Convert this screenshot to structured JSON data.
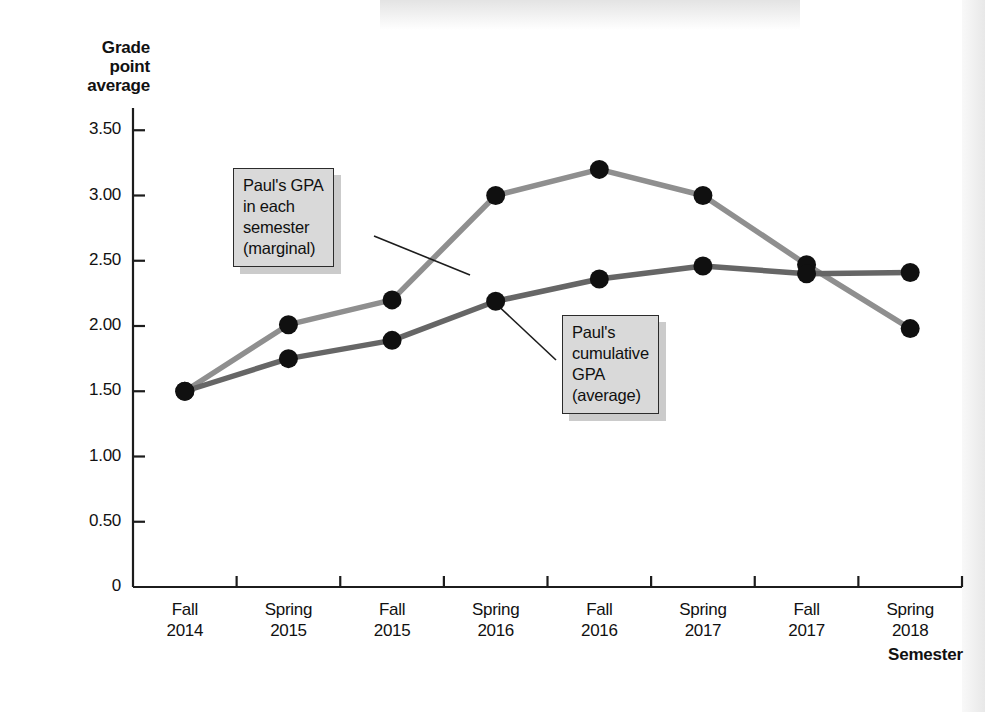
{
  "chart_data": {
    "type": "line",
    "title": "",
    "xlabel": "Semester",
    "ylabel": "Grade point average",
    "categories": [
      "Fall 2014",
      "Spring 2015",
      "Fall 2015",
      "Spring 2016",
      "Fall 2016",
      "Spring 2017",
      "Fall 2017",
      "Spring 2018"
    ],
    "category_lines": [
      [
        "Fall",
        "2014"
      ],
      [
        "Spring",
        "2015"
      ],
      [
        "Fall",
        "2015"
      ],
      [
        "Spring",
        "2016"
      ],
      [
        "Fall",
        "2016"
      ],
      [
        "Spring",
        "2017"
      ],
      [
        "Fall",
        "2017"
      ],
      [
        "Spring",
        "2018"
      ]
    ],
    "ylim": [
      0,
      3.75
    ],
    "yticks": [
      0,
      0.5,
      1.0,
      1.5,
      2.0,
      2.5,
      3.0,
      3.5
    ],
    "ytick_labels": [
      "0",
      "0.50",
      "1.00",
      "1.50",
      "2.00",
      "2.50",
      "3.00",
      "3.50"
    ],
    "grid": false,
    "legend_position": "annotations",
    "series": [
      {
        "name": "Paul's GPA in each semester (marginal)",
        "color": "#8f8f8f",
        "marker_color": "#101010",
        "values": [
          1.5,
          2.01,
          2.2,
          3.0,
          3.2,
          3.0,
          2.47,
          1.98
        ]
      },
      {
        "name": "Paul's cumulative GPA (average)",
        "color": "#666666",
        "marker_color": "#101010",
        "values": [
          1.5,
          1.75,
          1.89,
          2.19,
          2.36,
          2.46,
          2.4,
          2.41
        ]
      }
    ],
    "annotations": [
      {
        "id": "marginal",
        "lines": [
          "Paul's GPA",
          "in each",
          "semester",
          "(marginal)"
        ],
        "target_category": "Spring 2016",
        "target_value": 2.6
      },
      {
        "id": "cumulative",
        "lines": [
          "Paul's",
          "cumulative",
          "GPA",
          "(average)"
        ],
        "target_category": "Fall 2016",
        "target_value": 2.36
      }
    ]
  },
  "axes": {
    "y_title_lines": [
      "Grade",
      "point",
      "average"
    ],
    "x_title": "Semester"
  }
}
